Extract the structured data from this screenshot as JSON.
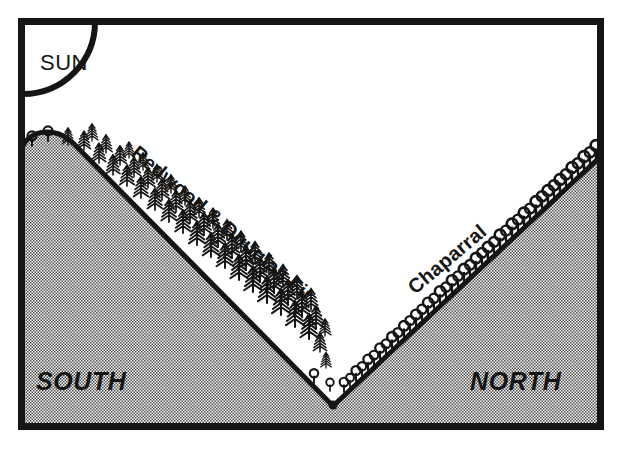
{
  "figure": {
    "name": "slope-aspect-vegetation-cross-section",
    "background_color": "#ffffff",
    "ink_color": "#151515",
    "hillshade_color": "#b4b4b4"
  },
  "frame": {
    "name": "outer-border",
    "x": 18,
    "y": 18,
    "width": 586,
    "height": 412,
    "stroke_width": 7,
    "color": "#151515"
  },
  "sun": {
    "label": "SUN",
    "icon": "sun-arc-icon",
    "center_x": 23,
    "center_y": 22,
    "radius": 72,
    "stroke_width": 6,
    "label_x": 40,
    "label_y": 70
  },
  "labels": {
    "south": "SOUTH",
    "north": "NORTH",
    "forest": "Redwood & Douglas Fir",
    "shrub": "Chaparral"
  },
  "label_placement": {
    "south": {
      "x": 36,
      "y": 390
    },
    "north": {
      "x": 470,
      "y": 390
    },
    "forest": {
      "x": 130,
      "y": 155,
      "rotation": 40
    },
    "shrub": {
      "x": 415,
      "y": 295,
      "rotation": -40
    }
  },
  "terrain": {
    "name": "valley-profile",
    "left_ridge_crest": {
      "x": 22,
      "y": 148
    },
    "valley_bottom": {
      "x": 333,
      "y": 406
    },
    "right_ridge_crest": {
      "x": 600,
      "y": 157
    },
    "south_slope_aspect": "south-facing",
    "north_slope_aspect": "north-facing",
    "profile_stroke_width": 5
  },
  "vegetation": {
    "south_facing_slope": {
      "type": "conifer-forest",
      "species": "Redwood & Douglas Fir",
      "symbol": "conifer-tree-icon",
      "count": 58
    },
    "north_facing_slope": {
      "type": "chaparral-shrubland",
      "species": "Chaparral",
      "symbol": "shrub-icon",
      "count": 42
    }
  },
  "chart_data": {
    "type": "line",
    "xlabel": "",
    "ylabel": "",
    "x": [
      22,
      333,
      600
    ],
    "y": [
      148,
      406,
      157
    ],
    "annotations": [
      "SUN",
      "SOUTH",
      "NORTH",
      "Redwood & Douglas Fir",
      "Chaparral"
    ]
  }
}
